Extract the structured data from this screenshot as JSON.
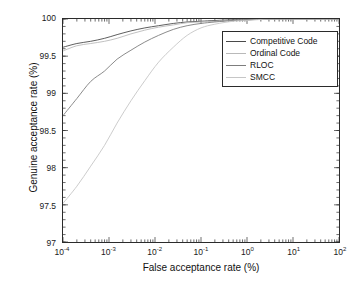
{
  "chart_data": {
    "type": "line",
    "title": "",
    "xlabel": "False acceptance rate (%)",
    "ylabel": "Genuine acceptance rate (%)",
    "xscale": "log",
    "xlim": [
      0.0001,
      100
    ],
    "ylim": [
      97,
      100
    ],
    "grid": false,
    "legend_position": "upper right",
    "xticks": [
      {
        "value": 0.0001,
        "mantissa": "10",
        "exponent": "-4"
      },
      {
        "value": 0.001,
        "mantissa": "10",
        "exponent": "-3"
      },
      {
        "value": 0.01,
        "mantissa": "10",
        "exponent": "-2"
      },
      {
        "value": 0.1,
        "mantissa": "10",
        "exponent": "-1"
      },
      {
        "value": 1,
        "mantissa": "10",
        "exponent": "0"
      },
      {
        "value": 10,
        "mantissa": "10",
        "exponent": "1"
      },
      {
        "value": 100,
        "mantissa": "10",
        "exponent": "2"
      }
    ],
    "yticks": [
      {
        "value": 97,
        "label": "97"
      },
      {
        "value": 97.5,
        "label": "97.5"
      },
      {
        "value": 98,
        "label": "98"
      },
      {
        "value": 98.5,
        "label": "98.5"
      },
      {
        "value": 99,
        "label": "99"
      },
      {
        "value": 99.5,
        "label": "99.5"
      },
      {
        "value": 100,
        "label": "100"
      }
    ],
    "series": [
      {
        "name": "Competitive Code",
        "color": "#4a4a4a",
        "x": [
          0.0001,
          0.0002,
          0.0004,
          0.0008,
          0.0015,
          0.003,
          0.006,
          0.012,
          0.025,
          0.05,
          0.1,
          0.2,
          0.5,
          1,
          3,
          10,
          30,
          100
        ],
        "y": [
          99.62,
          99.67,
          99.7,
          99.74,
          99.79,
          99.84,
          99.88,
          99.91,
          99.94,
          99.96,
          99.97,
          99.98,
          99.99,
          99.99,
          100,
          100,
          100,
          100
        ]
      },
      {
        "name": "Ordinal Code",
        "color": "#b9b9b9",
        "x": [
          0.0001,
          0.0002,
          0.0004,
          0.0008,
          0.0015,
          0.003,
          0.006,
          0.012,
          0.025,
          0.05,
          0.1,
          0.2,
          0.5,
          1,
          3,
          10,
          30,
          100
        ],
        "y": [
          99.57,
          99.64,
          99.67,
          99.7,
          99.74,
          99.8,
          99.85,
          99.89,
          99.92,
          99.95,
          99.96,
          99.97,
          99.98,
          99.99,
          100,
          100,
          100,
          100
        ]
      },
      {
        "name": "RLOC",
        "color": "#7d7d7d",
        "x": [
          0.0001,
          0.0002,
          0.0004,
          0.0008,
          0.0015,
          0.003,
          0.006,
          0.012,
          0.025,
          0.05,
          0.1,
          0.2,
          0.5,
          1,
          3,
          10,
          30,
          100
        ],
        "y": [
          98.7,
          98.93,
          99.16,
          99.3,
          99.46,
          99.58,
          99.69,
          99.78,
          99.86,
          99.91,
          99.94,
          99.96,
          99.98,
          99.99,
          100,
          100,
          100,
          100
        ]
      },
      {
        "name": "SMCC",
        "color": "#c6c6c6",
        "x": [
          0.0001,
          0.0002,
          0.0004,
          0.0008,
          0.0015,
          0.003,
          0.006,
          0.012,
          0.025,
          0.05,
          0.1,
          0.2,
          0.5,
          1,
          3,
          10,
          30,
          100
        ],
        "y": [
          97.52,
          97.75,
          98.02,
          98.3,
          98.6,
          98.9,
          99.17,
          99.42,
          99.62,
          99.78,
          99.88,
          99.93,
          99.97,
          99.98,
          100,
          100,
          100,
          100
        ]
      }
    ]
  },
  "axis": {
    "xlabel": "False acceptance rate (%)",
    "ylabel": "Genuine acceptance rate (%)"
  },
  "legend": {
    "entries": [
      {
        "label": "Competitive Code"
      },
      {
        "label": "Ordinal Code"
      },
      {
        "label": "RLOC"
      },
      {
        "label": "SMCC"
      }
    ]
  }
}
